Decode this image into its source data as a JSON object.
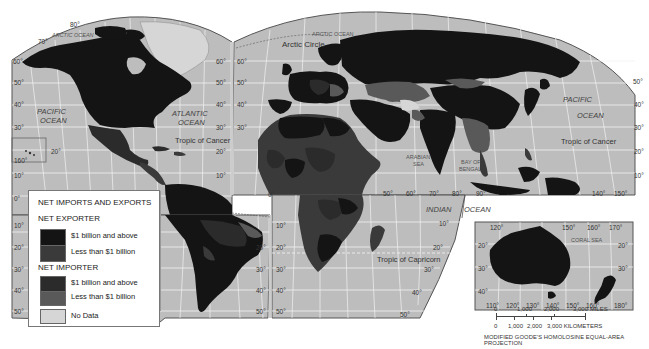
{
  "legend": {
    "title": "NET IMPORTS AND EXPORTS",
    "sections": [
      {
        "heading": "NET EXPORTER",
        "items": [
          {
            "label": "$1 billion and above",
            "color": "#141414"
          },
          {
            "label": "Less than $1 billion",
            "color": "#3a3a3a"
          }
        ]
      },
      {
        "heading": "NET IMPORTER",
        "items": [
          {
            "label": "$1 billion and above",
            "color": "#2b2b2b"
          },
          {
            "label": "Less than $1 billion",
            "color": "#595959"
          }
        ]
      }
    ],
    "no_data": {
      "label": "No Data",
      "color": "#d6d6d6"
    }
  },
  "colors": {
    "ocean": "#bdbdbd",
    "graticule": "#f2f2f2",
    "land_exporter_high": "#141414",
    "land_exporter_low": "#3a3a3a",
    "land_importer_high": "#2b2b2b",
    "land_importer_low": "#595959",
    "no_data": "#d6d6d6",
    "frame": "#555555"
  },
  "labels": {
    "oceans": {
      "arctic_left": "ARCTIC OCEAN",
      "arctic_right": "ARCTIC OCEAN",
      "pacific_left_1": "PACIFIC",
      "pacific_left_2": "OCEAN",
      "atlantic_1": "ATLANTIC",
      "atlantic_2": "OCEAN",
      "pacific_right_1": "PACIFIC",
      "pacific_right_2": "OCEAN",
      "indian_1": "INDIAN",
      "indian_2": "OCEAN",
      "arabian_sea_1": "ARABIAN",
      "arabian_sea_2": "SEA",
      "bay_bengal_1": "BAY OF",
      "bay_bengal_2": "BENGAL",
      "coral_sea": "CORAL SEA"
    },
    "lines": {
      "arctic_circle": "Arctic Circle",
      "tropic_cancer_left": "Tropic of Cancer",
      "tropic_cancer_right": "Tropic of Cancer",
      "tropic_capricorn": "Tropic of Capricorn"
    },
    "degrees": {
      "n80": "80°",
      "n70": "70°",
      "l60": "60°",
      "l50": "50°",
      "l40": "40°",
      "l30": "30°",
      "l20": "20°",
      "l10": "10°",
      "l0": "0°",
      "ls10": "10°",
      "ls20": "20°",
      "ls30": "30°",
      "ls40": "40°",
      "ls50": "50°",
      "r60": "60°",
      "r50": "50°",
      "r40": "40°",
      "r30": "30°",
      "r20": "20°",
      "r10": "10°",
      "m60": "60°",
      "m50": "50°",
      "m40": "40°",
      "m30": "30°",
      "hawaii_20": "20°",
      "hawaii_160": "160°",
      "sa_r20": "20°",
      "sa_r30": "30°",
      "sa_r40": "40°",
      "sa_r50": "50°",
      "af_l20": "20°",
      "af_l30": "30°",
      "af_l40": "40°",
      "af_l50": "50°",
      "af_l10": "10°",
      "af_0": "0°",
      "af_r10": "10°",
      "af_r20": "20°",
      "af_r30": "30°",
      "af_r40": "40°",
      "af_r50": "50°",
      "lon50": "50°",
      "lon60": "60°",
      "lon70": "70°",
      "lon80": "80°",
      "lon90": "90°",
      "ind10": "10°",
      "pr50": "50°",
      "pr40": "40°",
      "pr30": "30°",
      "pr20": "20°",
      "pr10": "10°",
      "lon140": "140°",
      "lon150": "150°",
      "au_120": "120°",
      "au_150": "150°",
      "au_160": "160°",
      "au_170": "170°",
      "au_l20": "20°",
      "au_l30": "30°",
      "au_l40": "40°",
      "au_r20": "20°",
      "au_r30": "30°",
      "au_b110": "110°",
      "au_b120": "120°",
      "au_b130": "130°",
      "au_b140": "140°",
      "au_b150": "150°",
      "au_b160": "160°",
      "au_b180": "180°"
    }
  },
  "scale": {
    "miles": [
      "0",
      "1,000",
      "2,000",
      "3,000 MILES"
    ],
    "kilometers": [
      "0",
      "1,000",
      "2,000",
      "3,000 KILOMETERS"
    ]
  },
  "projection": "MODIFIED GOODE'S HOMOLOSINE EQUAL-AREA PROJECTION"
}
